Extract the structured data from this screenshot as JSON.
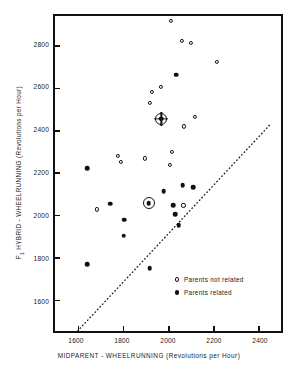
{
  "chart_data": {
    "type": "scatter",
    "title": "",
    "xlabel": "MIDPARENT - WHEELRUNNING (Revolutions per Hour)",
    "ylabel": "F1 HYBRID - WHEELRUNNING (Revolutions per Hour)",
    "xlim": [
      1500,
      2500
    ],
    "ylim": [
      1600,
      2900
    ],
    "xticks": [
      1600,
      1800,
      2000,
      2200,
      2400
    ],
    "yticks": [
      1600,
      1800,
      2000,
      2200,
      2400,
      2600,
      2800
    ],
    "grid": false,
    "legend_position": "lower-right",
    "legend": [
      {
        "key": "not_related",
        "label": "Parents not related",
        "marker": "open-circle"
      },
      {
        "key": "related",
        "label": "Parents related",
        "marker": "filled-circle"
      }
    ],
    "reference_line": {
      "style": "dotted",
      "label": "",
      "x": [
        1600,
        2452
      ],
      "y": [
        1600,
        2452
      ]
    },
    "series": [
      {
        "name": "Parents not related",
        "marker": "open-circle",
        "points": [
          [
            2005,
            2880
          ],
          [
            2052,
            2800
          ],
          [
            2090,
            2790
          ],
          [
            2205,
            2712
          ],
          [
            1960,
            2612
          ],
          [
            1922,
            2592
          ],
          [
            1912,
            2545
          ],
          [
            2110,
            2488
          ],
          [
            1962,
            2482
          ],
          [
            2060,
            2450
          ],
          [
            2010,
            2345
          ],
          [
            1772,
            2330
          ],
          [
            1892,
            2320
          ],
          [
            1788,
            2305
          ],
          [
            2000,
            2292
          ],
          [
            1682,
            2112
          ],
          [
            2058,
            2128
          ]
        ]
      },
      {
        "name": "Parents related",
        "marker": "filled-circle",
        "points": [
          [
            2028,
            2660
          ],
          [
            1640,
            2280
          ],
          [
            2055,
            2210
          ],
          [
            2100,
            2202
          ],
          [
            1972,
            2185
          ],
          [
            1740,
            2135
          ],
          [
            2015,
            2128
          ],
          [
            2022,
            2092
          ],
          [
            1800,
            2070
          ],
          [
            2038,
            2048
          ],
          [
            1798,
            2005
          ],
          [
            1640,
            1888
          ],
          [
            1912,
            1872
          ]
        ]
      }
    ],
    "highlighted_points": [
      {
        "x": 1962,
        "y": 2482,
        "marker": "crosshair-target",
        "note": "mean of parents not related"
      },
      {
        "x": 1908,
        "y": 2138,
        "marker": "ringed-dot",
        "note": "mean of parents related"
      }
    ]
  },
  "axes": {
    "x_title": "MIDPARENT - WHEELRUNNING (Revolutions per Hour)",
    "y_title_main": "F",
    "y_title_sub": "1",
    "y_title_rest": " HYBRID - WHEELRUNNING (Revolutions per Hour)",
    "x_tick_labels": [
      "1600",
      "1800",
      "2000",
      "2200",
      "2400"
    ],
    "y_tick_labels": [
      "2800",
      "2600",
      "2400",
      "2200",
      "2000",
      "1800",
      "1600"
    ]
  },
  "legend": {
    "items": [
      {
        "label": "Parents not related"
      },
      {
        "label": "Parents related"
      }
    ]
  },
  "colors": {
    "ink": "#111111",
    "background": "#ffffff"
  }
}
